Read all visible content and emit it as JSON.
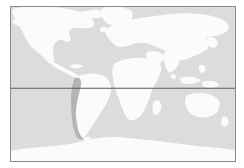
{
  "map": {
    "title": "World Map",
    "projection": "equirectangular",
    "frame": {
      "border_color": "#8a8a8a",
      "border_width_px": 1,
      "x": 10,
      "y": 6,
      "width": 226,
      "height": 156
    },
    "colors": {
      "page_background": "#ffffff",
      "ocean": "#dcdcdc",
      "land": "#fbfbfb",
      "highlight": "#b4b4b4",
      "graticule_line": "#5a5a5a"
    },
    "graticule": {
      "lines": [
        {
          "name": "equator",
          "label": "Equator",
          "orientation": "horizontal",
          "y_fraction": 0.528,
          "color": "#5a5a5a",
          "width_px": 1
        }
      ]
    },
    "highlighted_regions": [
      {
        "name": "chile",
        "label": "Chile",
        "color": "#b4b4b4",
        "continent": "South America",
        "position": "west coast"
      }
    ],
    "landmasses": [
      {
        "name": "north-america",
        "label": "North America"
      },
      {
        "name": "south-america",
        "label": "South America"
      },
      {
        "name": "greenland",
        "label": "Greenland"
      },
      {
        "name": "eurasia",
        "label": "Eurasia"
      },
      {
        "name": "africa",
        "label": "Africa"
      },
      {
        "name": "australia",
        "label": "Australia"
      },
      {
        "name": "antarctica",
        "label": "Antarctica"
      },
      {
        "name": "indonesia",
        "label": "Indonesia"
      },
      {
        "name": "japan",
        "label": "Japan"
      },
      {
        "name": "new-zealand",
        "label": "New Zealand"
      },
      {
        "name": "madagascar",
        "label": "Madagascar"
      },
      {
        "name": "british-isles",
        "label": "British Isles"
      },
      {
        "name": "iceland",
        "label": "Iceland"
      },
      {
        "name": "caribbean",
        "label": "Caribbean"
      },
      {
        "name": "philippines",
        "label": "Philippines"
      },
      {
        "name": "sri-lanka",
        "label": "Sri Lanka"
      }
    ],
    "shapes": {
      "north_america": "M 10,2 L 34,0 L 58,1 L 74,4 L 86,3 L 96,6 L 92,11 L 80,12 L 86,16 L 80,21 L 66,20 L 60,24 L 64,30 L 60,36 L 54,33 L 48,36 L 44,44 L 47,52 L 44,60 L 38,56 L 31,48 L 24,45 L 18,38 L 14,28 L 9,20 L 4,12 L 6,6 Z",
      "central_america": "M 44,60 L 52,63 L 58,66 L 64,70 L 70,73 L 66,76 L 60,73 L 54,69 L 48,66 Z",
      "greenland": "M 98,0 L 118,1 L 126,6 L 122,14 L 114,20 L 104,18 L 98,11 L 96,4 Z",
      "south_america": "M 70,74 L 80,71 L 92,72 L 100,77 L 104,86 L 101,96 L 96,106 L 90,116 L 84,126 L 79,134 L 74,140 L 70,136 L 72,128 L 70,118 L 66,106 L 64,94 L 66,84 Z",
      "chile_highlight": "M 70,74 L 74,76 L 72,86 L 70,96 L 69,106 L 68,116 L 69,126 L 72,134 L 74,140 L 70,136 L 66,130 L 65,120 L 64,108 L 63,96 L 64,85 L 66,78 Z",
      "africa": "M 116,60 L 128,57 L 140,56 L 150,58 L 156,62 L 154,70 L 150,78 L 146,86 L 144,96 L 140,106 L 134,114 L 128,120 L 122,116 L 118,106 L 114,96 L 110,86 L 108,76 L 110,66 Z",
      "europe": "M 112,20 L 126,18 L 140,19 L 150,22 L 146,28 L 138,32 L 130,36 L 122,40 L 116,44 L 112,40 L 108,32 L 108,24 Z",
      "asia": "M 146,14 L 170,10 L 196,8 L 216,12 L 224,20 L 218,28 L 206,32 L 210,40 L 202,48 L 194,54 L 186,58 L 178,56 L 172,50 L 164,46 L 156,42 L 150,36 L 148,26 Z",
      "india": "M 164,46 L 172,48 L 176,56 L 172,64 L 166,70 L 162,62 L 160,52 Z",
      "australia": "M 186,96 L 202,94 L 214,98 L 218,106 L 214,114 L 204,118 L 192,116 L 186,108 Z",
      "antarctica": "M 8,152 L 30,150 L 52,148 L 74,145 L 96,142 L 118,140 L 140,141 L 162,143 L 184,145 L 206,147 L 226,150 L 226,160 L 8,160 Z",
      "indonesia": "M 178,76 L 190,74 L 198,78 L 192,82 L 182,82 Z",
      "japan": "M 208,36 L 214,32 L 218,38 L 214,44 L 210,42 Z",
      "madagascar": "M 152,104 L 157,102 L 159,110 L 155,116 L 151,112 Z",
      "new_zealand": "M 222,120 L 227,118 L 229,126 L 225,130 L 221,126 Z",
      "british_isles": "M 106,26 L 111,24 L 112,30 L 108,33 L 105,30 Z"
    }
  }
}
